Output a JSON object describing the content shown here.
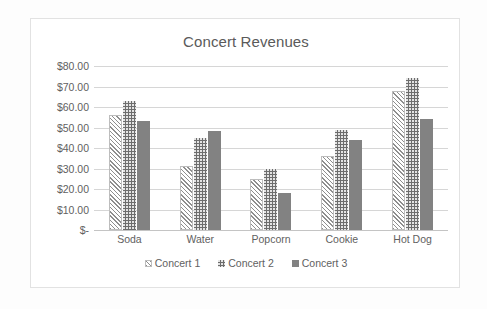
{
  "chart_data": {
    "type": "bar",
    "title": "Concert Revenues",
    "xlabel": "",
    "ylabel": "",
    "categories": [
      "Soda",
      "Water",
      "Popcorn",
      "Cookie",
      "Hot Dog"
    ],
    "series": [
      {
        "name": "Concert 1",
        "pattern": "diagonal-hatch",
        "color": "#f4f4f4",
        "values": [
          56,
          31,
          25,
          36,
          68
        ]
      },
      {
        "name": "Concert 2",
        "pattern": "dotted",
        "color": "#6d6d6d",
        "values": [
          63,
          45,
          30,
          49,
          74
        ]
      },
      {
        "name": "Concert 3",
        "pattern": "solid",
        "color": "#828282",
        "values": [
          53,
          48.5,
          18,
          44,
          54
        ]
      }
    ],
    "ylim": [
      0,
      80
    ],
    "ytick_values": [
      80,
      70,
      60,
      50,
      40,
      30,
      20,
      10,
      0
    ],
    "ytick_labels": [
      "$80.00",
      "$70.00",
      "$60.00",
      "$50.00",
      "$40.00",
      "$30.00",
      "$20.00",
      "$10.00",
      "$-"
    ],
    "grid": true,
    "legend_position": "bottom",
    "axis_label_color": "#616161",
    "gridline_color": "#d6d6d6"
  }
}
